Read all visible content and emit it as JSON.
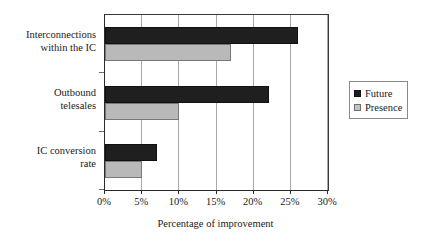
{
  "chart_data": {
    "type": "bar",
    "orientation": "horizontal",
    "title": "",
    "xlabel": "Percentage of improvement",
    "ylabel": "",
    "xlim": [
      0,
      30
    ],
    "xticks": [
      0,
      5,
      10,
      15,
      20,
      25,
      30
    ],
    "xtick_labels": [
      "0%",
      "5%",
      "10%",
      "15%",
      "20%",
      "25%",
      "30%"
    ],
    "grid": true,
    "grid_axis": "x",
    "legend_position": "right",
    "categories": [
      "Interconnections within the IC",
      "Outbound telesales",
      "IC conversion rate"
    ],
    "category_lines": [
      [
        "Interconnections",
        "within the IC"
      ],
      [
        "Outbound",
        "telesales"
      ],
      [
        "IC conversion",
        "rate"
      ]
    ],
    "series": [
      {
        "name": "Future",
        "color": "#1f1f1f",
        "values": [
          26,
          22,
          7
        ]
      },
      {
        "name": "Presence",
        "color": "#b9b9b9",
        "values": [
          17,
          10,
          5
        ]
      }
    ]
  },
  "legend": {
    "entries": [
      {
        "label": "Future"
      },
      {
        "label": "Presence"
      }
    ]
  }
}
